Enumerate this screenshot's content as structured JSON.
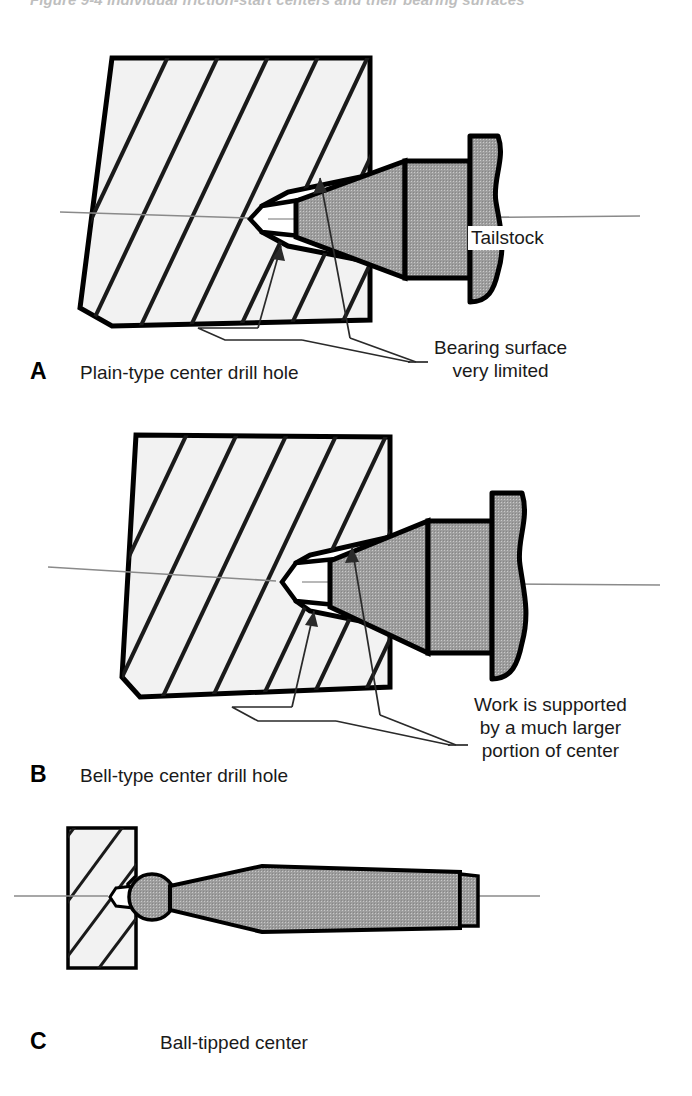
{
  "figure": {
    "top_caption": "Figure 9-4 Individual friction-start centers and their bearing surfaces"
  },
  "colors": {
    "center_gray": "#9d9d9d",
    "workpiece_fill": "#f2f2f2",
    "outline": "#000000",
    "hatch": "#1a1a1a",
    "centerline": "#8a8a8a",
    "leader": "#2a2a2a"
  },
  "panels": [
    {
      "id": "a",
      "letter": "A",
      "caption": "Plain-type center drill hole",
      "parts": {
        "workpiece": "hatched-workpiece",
        "center": "tailstock-center",
        "drill_hole": "plain-type-center-drill-hole"
      },
      "labels": [
        {
          "name": "tailstock-label",
          "text": "Tailstock"
        }
      ],
      "notes": [
        {
          "name": "bearing-surface-note",
          "lines": [
            "Bearing surface",
            "very limited"
          ]
        }
      ]
    },
    {
      "id": "b",
      "letter": "B",
      "caption": "Bell-type center drill hole",
      "parts": {
        "workpiece": "hatched-workpiece",
        "center": "tailstock-center",
        "drill_hole": "bell-type-center-drill-hole"
      },
      "labels": [],
      "notes": [
        {
          "name": "work-supported-note",
          "lines": [
            "Work is supported",
            "by a much larger",
            "portion of center"
          ]
        }
      ]
    },
    {
      "id": "c",
      "letter": "C",
      "caption": "Ball-tipped center",
      "parts": {
        "workpiece": "hatched-workpiece",
        "center": "ball-tipped-center",
        "drill_hole": "plain-type-center-drill-hole"
      },
      "labels": [],
      "notes": []
    }
  ]
}
